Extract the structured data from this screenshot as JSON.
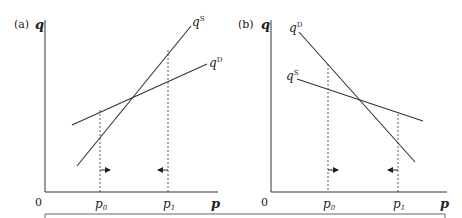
{
  "panels": [
    {
      "id": "a",
      "label": "(a)",
      "y_axis_label": "q",
      "x_axis_label": "p",
      "origin_label": "0",
      "ticks": [
        {
          "base": "p",
          "sub": "0"
        },
        {
          "base": "p",
          "sub": "1"
        }
      ],
      "curves": [
        {
          "name": "supply",
          "base": "q",
          "sup": "S"
        },
        {
          "name": "demand",
          "base": "q",
          "sup": "D"
        }
      ],
      "arrows": [
        "right",
        "left"
      ]
    },
    {
      "id": "b",
      "label": "(b)",
      "y_axis_label": "q",
      "x_axis_label": "p",
      "origin_label": "0",
      "ticks": [
        {
          "base": "p",
          "sub": "0"
        },
        {
          "base": "p",
          "sub": "1"
        }
      ],
      "curves": [
        {
          "name": "demand",
          "base": "q",
          "sup": "D"
        },
        {
          "name": "supply",
          "base": "q",
          "sup": "S"
        }
      ],
      "arrows": [
        "right",
        "left"
      ]
    }
  ],
  "colors": {
    "line": "#333333",
    "text": "#222222"
  }
}
